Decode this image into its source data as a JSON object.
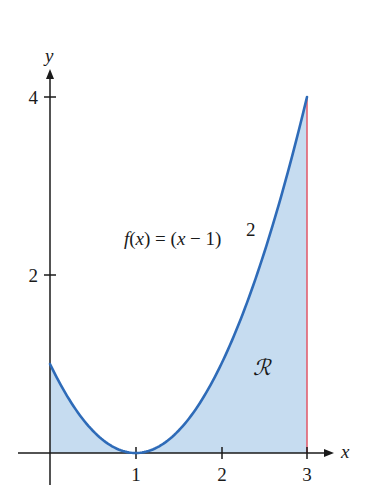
{
  "figure": {
    "function_label": "f(x) = (x − 1)",
    "function_exponent": "2",
    "region_label": "ℛ",
    "x_axis_label": "x",
    "y_axis_label": "y",
    "x_ticks": [
      "1",
      "2",
      "3"
    ],
    "y_ticks": [
      "2",
      "4"
    ]
  },
  "colors": {
    "curve": "#2e6bb8",
    "fill": "#c6dcf0",
    "boundary": "#e06070",
    "axes": "#1a1a1a"
  },
  "chart_data": {
    "type": "area",
    "title": "",
    "function": "f(x) = (x - 1)^2",
    "xlabel": "x",
    "ylabel": "y",
    "xlim": [
      0,
      3
    ],
    "ylim": [
      0,
      4
    ],
    "x_ticks": [
      1,
      2,
      3
    ],
    "y_ticks": [
      2,
      4
    ],
    "x": [
      0,
      0.5,
      1,
      1.5,
      2,
      2.5,
      3
    ],
    "values": [
      1,
      0.25,
      0,
      0.25,
      1,
      2.25,
      4
    ],
    "shaded_region": {
      "label": "R",
      "from_x": 0,
      "to_x": 3,
      "between": [
        "f(x)",
        "y=0"
      ]
    },
    "annotations": [
      "f(x) = (x - 1)^2",
      "R"
    ],
    "grid": false
  }
}
